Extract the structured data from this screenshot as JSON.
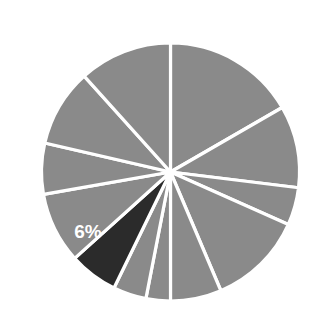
{
  "chart_data": {
    "type": "pie",
    "title": "",
    "subtitle": "",
    "xlabel": "",
    "ylabel": "",
    "grid": false,
    "legend": "none",
    "center": {
      "cx": 170.5,
      "cy": 172.0
    },
    "radius": 129,
    "start_angle_deg": 0,
    "direction": "clockwise",
    "background_color": "#ffffff",
    "separator_color": "#ffffff",
    "default_slice_color": "#8a8a8a",
    "highlight_slice_color": "#2b2b2b",
    "label_text_color": "#ffffff",
    "categories": [
      "slice-1",
      "slice-2",
      "slice-3",
      "slice-4",
      "slice-5",
      "slice-6",
      "slice-7",
      "slice-8",
      "slice-9",
      "slice-10",
      "slice-11",
      "slice-12"
    ],
    "values": [
      16.7,
      10.3,
      4.7,
      12.0,
      6.4,
      3.1,
      4.2,
      6.0,
      8.9,
      6.4,
      9.7,
      11.6
    ],
    "angles_deg": [
      60,
      37,
      17,
      43,
      23,
      11,
      15,
      22,
      32,
      23,
      35,
      42
    ],
    "slices": [
      {
        "name": "slice-1",
        "start_deg": 0,
        "end_deg": 60,
        "value": 16.7,
        "color": "#8a8a8a",
        "label": "",
        "highlight": false
      },
      {
        "name": "slice-2",
        "start_deg": 60,
        "end_deg": 97,
        "value": 10.3,
        "color": "#8a8a8a",
        "label": "",
        "highlight": false
      },
      {
        "name": "slice-3",
        "start_deg": 97,
        "end_deg": 114,
        "value": 4.7,
        "color": "#8a8a8a",
        "label": "",
        "highlight": false
      },
      {
        "name": "slice-4",
        "start_deg": 114,
        "end_deg": 157,
        "value": 12.0,
        "color": "#8a8a8a",
        "label": "",
        "highlight": false
      },
      {
        "name": "slice-5",
        "start_deg": 157,
        "end_deg": 180,
        "value": 6.4,
        "color": "#8a8a8a",
        "label": "",
        "highlight": false
      },
      {
        "name": "slice-6",
        "start_deg": 180,
        "end_deg": 191,
        "value": 3.1,
        "color": "#8a8a8a",
        "label": "",
        "highlight": false
      },
      {
        "name": "slice-7",
        "start_deg": 191,
        "end_deg": 206,
        "value": 4.2,
        "color": "#8a8a8a",
        "label": "",
        "highlight": false
      },
      {
        "name": "slice-8",
        "start_deg": 206,
        "end_deg": 228,
        "value": 6.0,
        "color": "#2b2b2b",
        "label": "6%",
        "highlight": true
      },
      {
        "name": "slice-9",
        "start_deg": 228,
        "end_deg": 260,
        "value": 8.9,
        "color": "#8a8a8a",
        "label": "",
        "highlight": false
      },
      {
        "name": "slice-10",
        "start_deg": 260,
        "end_deg": 283,
        "value": 6.4,
        "color": "#8a8a8a",
        "label": "",
        "highlight": false
      },
      {
        "name": "slice-11",
        "start_deg": 283,
        "end_deg": 318,
        "value": 9.7,
        "color": "#8a8a8a",
        "label": "",
        "highlight": false
      },
      {
        "name": "slice-12",
        "start_deg": 318,
        "end_deg": 360,
        "value": 11.6,
        "color": "#8a8a8a",
        "label": "",
        "highlight": false
      }
    ],
    "annotations": [
      {
        "name": "highlight-percentage-label",
        "text": "6%",
        "x": 88,
        "y": 233
      }
    ]
  }
}
